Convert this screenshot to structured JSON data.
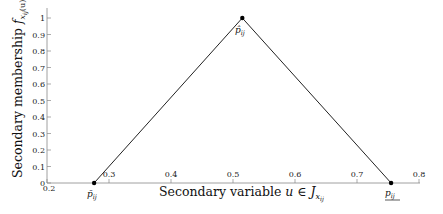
{
  "chart_data": {
    "type": "line",
    "title": "",
    "xlabel": "Secondary variable u ∈ J_{x_ij}",
    "ylabel": "Secondary membership f_{x_ij}(u)/u",
    "xlim": [
      0.2,
      0.8
    ],
    "ylim": [
      0,
      1
    ],
    "xticks": [
      0.2,
      0.3,
      0.4,
      0.5,
      0.6,
      0.7,
      0.8
    ],
    "xtick_labels": [
      "0.2",
      "0.3",
      "0.4",
      "0.5",
      "0.6",
      "0.7",
      "0.8"
    ],
    "yticks": [
      0,
      0.1,
      0.2,
      0.3,
      0.4,
      0.5,
      0.6,
      0.7,
      0.8,
      0.9,
      1
    ],
    "ytick_labels": [
      "0",
      "0.1",
      "0.2",
      "0.3",
      "0.4",
      "0.5",
      "0.6",
      "0.7",
      "0.8",
      "0.9",
      "1"
    ],
    "grid": false,
    "legend": null,
    "series": [
      {
        "name": "triangular secondary membership",
        "x": [
          0.276,
          0.515,
          0.755
        ],
        "y": [
          0,
          1,
          0
        ],
        "color": "#222222"
      }
    ],
    "annotations": [
      {
        "text": "p̄_ij",
        "x": 0.276,
        "y": 0,
        "position": "below"
      },
      {
        "text": "p̂_ij",
        "x": 0.515,
        "y": 1,
        "position": "below"
      },
      {
        "text": "p_ij (underlined)",
        "x": 0.755,
        "y": 0,
        "position": "below"
      }
    ]
  },
  "labels": {
    "xlabel_main": "Secondary variable ",
    "xlabel_var": "u",
    "xlabel_in": " ∈ ",
    "xlabel_J": "J",
    "xlabel_sub": "x",
    "xlabel_subsub": "ij",
    "ylabel_main": "Secondary membership ",
    "ylabel_f": "f",
    "ylabel_sub": "x",
    "ylabel_subsub": "ij",
    "ylabel_arg": "(u)",
    "ylabel_tail": "/u",
    "p_left": "p̄",
    "p_peak": "p̂",
    "p_right": "p",
    "p_sub": "ij"
  }
}
